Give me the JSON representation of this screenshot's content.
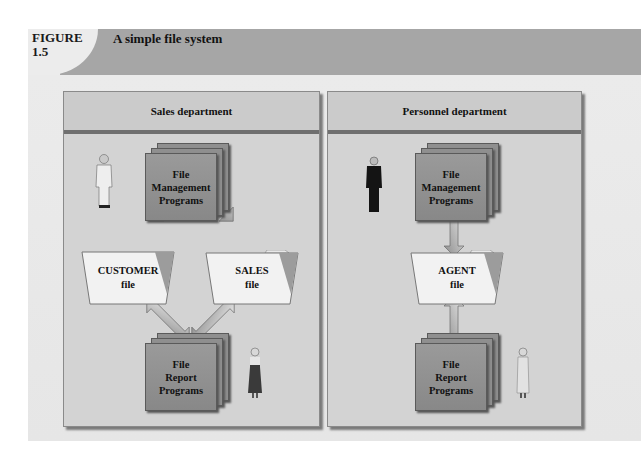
{
  "figure": {
    "label_line1": "FIGURE",
    "label_line2": "1.5",
    "title": "A simple file system"
  },
  "colors": {
    "header_band": "#a6a6a6",
    "panel_fill": "#d3d3d3",
    "program_card": "#8f8f8f",
    "folder_fill": "#f2f2f2"
  },
  "departments": [
    {
      "name": "Sales department",
      "management_programs": {
        "line1": "File",
        "line2": "Management",
        "line3": "Programs"
      },
      "files": [
        {
          "line1": "CUSTOMER",
          "line2": "file"
        },
        {
          "line1": "SALES",
          "line2": "file"
        }
      ],
      "report_programs": {
        "line1": "File",
        "line2": "Report",
        "line3": "Programs"
      },
      "people": [
        "man-in-light-suit-icon",
        "woman-in-dark-dress-icon"
      ]
    },
    {
      "name": "Personnel department",
      "management_programs": {
        "line1": "File",
        "line2": "Management",
        "line3": "Programs"
      },
      "files": [
        {
          "line1": "AGENT",
          "line2": "file"
        }
      ],
      "report_programs": {
        "line1": "File",
        "line2": "Report",
        "line3": "Programs"
      },
      "people": [
        "man-in-dark-suit-icon",
        "woman-in-light-dress-icon"
      ]
    }
  ]
}
